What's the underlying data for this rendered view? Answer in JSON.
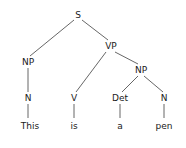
{
  "diagram": {
    "type": "syntax-tree",
    "line_color": "#555555",
    "text_color": "#1a1a1a",
    "nodes": [
      {
        "id": "S",
        "label": "S",
        "x": 78,
        "y": 15
      },
      {
        "id": "NP1",
        "label": "NP",
        "x": 28,
        "y": 62
      },
      {
        "id": "VP",
        "label": "VP",
        "x": 111,
        "y": 46
      },
      {
        "id": "N1",
        "label": "N",
        "x": 28,
        "y": 98
      },
      {
        "id": "V",
        "label": "V",
        "x": 74,
        "y": 98
      },
      {
        "id": "NP2",
        "label": "NP",
        "x": 141,
        "y": 70
      },
      {
        "id": "Det",
        "label": "Det",
        "x": 120,
        "y": 98
      },
      {
        "id": "N2",
        "label": "N",
        "x": 164,
        "y": 98
      },
      {
        "id": "w1",
        "label": "This",
        "x": 30,
        "y": 126
      },
      {
        "id": "w2",
        "label": "is",
        "x": 74,
        "y": 126
      },
      {
        "id": "w3",
        "label": "a",
        "x": 120,
        "y": 126
      },
      {
        "id": "w4",
        "label": "pen",
        "x": 164,
        "y": 126
      }
    ],
    "edges": [
      {
        "x1": 74,
        "y1": 20,
        "x2": 30,
        "y2": 56
      },
      {
        "x1": 82,
        "y1": 20,
        "x2": 108,
        "y2": 40
      },
      {
        "x1": 28,
        "y1": 68,
        "x2": 28,
        "y2": 92
      },
      {
        "x1": 106,
        "y1": 52,
        "x2": 76,
        "y2": 92
      },
      {
        "x1": 115,
        "y1": 52,
        "x2": 138,
        "y2": 64
      },
      {
        "x1": 138,
        "y1": 76,
        "x2": 122,
        "y2": 92
      },
      {
        "x1": 144,
        "y1": 76,
        "x2": 163,
        "y2": 92
      },
      {
        "x1": 28,
        "y1": 104,
        "x2": 28,
        "y2": 118
      },
      {
        "x1": 74,
        "y1": 104,
        "x2": 74,
        "y2": 118
      },
      {
        "x1": 120,
        "y1": 104,
        "x2": 120,
        "y2": 118
      },
      {
        "x1": 164,
        "y1": 104,
        "x2": 164,
        "y2": 118
      }
    ]
  }
}
